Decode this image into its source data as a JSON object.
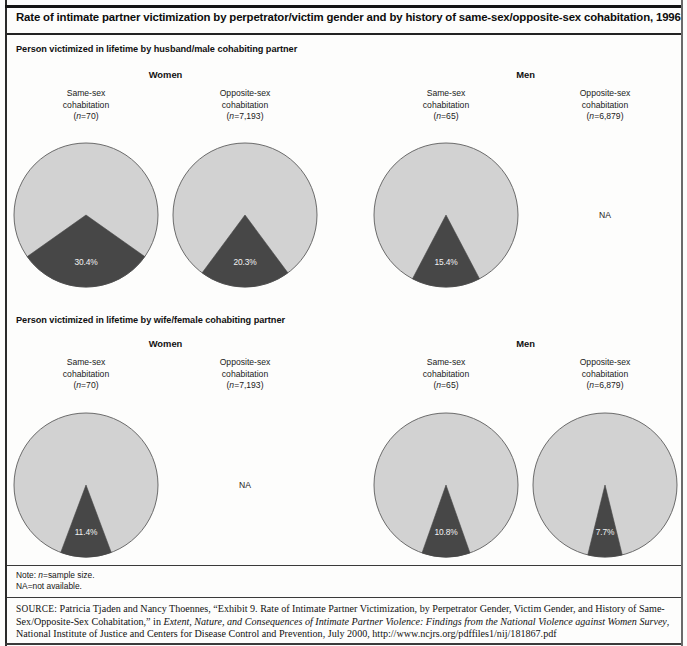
{
  "title": "Rate of intimate partner victimization by perpetrator/victim gender and by history of same-sex/opposite-sex cohabitation, 1996",
  "notes": {
    "line1_prefix": "Note: ",
    "line1_italic": "n",
    "line1_suffix": "=sample size.",
    "line2": "NA=not available."
  },
  "source": {
    "label": "SOURCE:",
    "text_1": " Patricia Tjaden and Nancy Thoennes, “Exhibit 9. Rate of Intimate Partner Victimization, by Perpetrator Gender, Victim Gender, and History of Same-Sex/Opposite-Sex Cohabitation,” in ",
    "italic_1": "Extent, Nature, and Consequences of Intimate Partner Violence: Findings from the National Violence against Women Survey",
    "text_2": ", National Institute of Justice and Centers for Disease Control and Prevention, July 2000, http://www.ncjrs.org/pdffiles1/nij/181867.pdf"
  },
  "colors": {
    "wedge": "#474747",
    "remainder": "#d2d2d2",
    "outline": "#6b6b6b",
    "value_text": "#f2f2f2",
    "rule": "#141414"
  },
  "chart_data": {
    "type": "pie",
    "title": "Rate of intimate partner victimization by perpetrator/victim gender and by history of same-sex/opposite-sex cohabitation, 1996",
    "unit": "percent",
    "wedge_start_angle_deg": 180,
    "legend": "none",
    "sections": [
      {
        "header": "Person victimized in lifetime by husband/male cohabiting partner",
        "groups": [
          {
            "gender": "Women",
            "columns": [
              {
                "caption_line1": "Same-sex",
                "caption_line2": "cohabitation",
                "n_prefix": "(",
                "n_italic": "n",
                "n_value": "=70)",
                "n": 70,
                "value": 30.4,
                "value_label": "30.4%",
                "available": true
              },
              {
                "caption_line1": "Opposite-sex",
                "caption_line2": "cohabitation",
                "n_prefix": "(",
                "n_italic": "n",
                "n_value": "=7,193)",
                "n": 7193,
                "value": 20.3,
                "value_label": "20.3%",
                "available": true
              }
            ]
          },
          {
            "gender": "Men",
            "columns": [
              {
                "caption_line1": "Same-sex",
                "caption_line2": "cohabitation",
                "n_prefix": "(",
                "n_italic": "n",
                "n_value": "=65)",
                "n": 65,
                "value": 15.4,
                "value_label": "15.4%",
                "available": true
              },
              {
                "caption_line1": "Opposite-sex",
                "caption_line2": "cohabitation",
                "n_prefix": "(",
                "n_italic": "n",
                "n_value": "=6,879)",
                "n": 6879,
                "value": null,
                "value_label": "NA",
                "available": false
              }
            ]
          }
        ]
      },
      {
        "header": "Person victimized in lifetime by wife/female cohabiting partner",
        "groups": [
          {
            "gender": "Women",
            "columns": [
              {
                "caption_line1": "Same-sex",
                "caption_line2": "cohabitation",
                "n_prefix": "(",
                "n_italic": "n",
                "n_value": "=70)",
                "n": 70,
                "value": 11.4,
                "value_label": "11.4%",
                "available": true
              },
              {
                "caption_line1": "Opposite-sex",
                "caption_line2": "cohabitation",
                "n_prefix": "(",
                "n_italic": "n",
                "n_value": "=7,193)",
                "n": 7193,
                "value": null,
                "value_label": "NA",
                "available": false
              }
            ]
          },
          {
            "gender": "Men",
            "columns": [
              {
                "caption_line1": "Same-sex",
                "caption_line2": "cohabitation",
                "n_prefix": "(",
                "n_italic": "n",
                "n_value": "=65)",
                "n": 65,
                "value": 10.8,
                "value_label": "10.8%",
                "available": true
              },
              {
                "caption_line1": "Opposite-sex",
                "caption_line2": "cohabitation",
                "n_prefix": "(",
                "n_italic": "n",
                "n_value": "=6,879)",
                "n": 6879,
                "value": 7.7,
                "value_label": "7.7%",
                "available": true
              }
            ]
          }
        ]
      }
    ]
  }
}
